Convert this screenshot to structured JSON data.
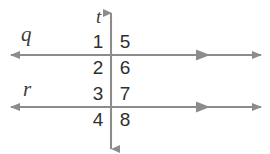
{
  "diagram": {
    "type": "two-parallel-lines-cut-by-transversal",
    "background_color": "#ffffff",
    "line_color": "#8c8c8c",
    "label_color": "#3b3b3b",
    "number_color": "#2f2f2f",
    "line_labels": {
      "parallel_top": "q",
      "parallel_bottom": "r",
      "transversal": "t"
    },
    "angle_numbers": {
      "top_left": "1",
      "top_right": "5",
      "upper_mid_left": "2",
      "upper_mid_right": "6",
      "lower_mid_left": "3",
      "lower_mid_right": "7",
      "bottom_left": "4",
      "bottom_right": "8"
    },
    "geometry": {
      "transversal_x": 111,
      "line_q_y": 55,
      "line_r_y": 107,
      "transversal_top_y": 12,
      "transversal_bottom_y": 150,
      "horizontal_left_x": 10,
      "horizontal_right_x": 262,
      "inner_arrow_x": 205
    }
  }
}
